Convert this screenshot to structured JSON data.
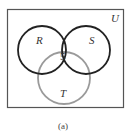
{
  "diagram": {
    "type": "venn",
    "universe": {
      "label": "U",
      "border_color": "#555555"
    },
    "sets": [
      {
        "id": "R",
        "label": "R",
        "color": "#222222"
      },
      {
        "id": "S",
        "label": "S",
        "color": "#222222"
      },
      {
        "id": "T",
        "label": "T",
        "color": "#999999"
      }
    ],
    "regions": [
      {
        "sets": [
          "R",
          "S",
          "T"
        ],
        "value": "5"
      }
    ],
    "caption": "(a)"
  }
}
